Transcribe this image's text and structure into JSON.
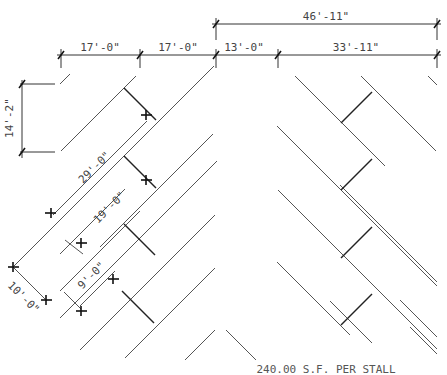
{
  "diagram": {
    "footer_text": "240.00 S.F. PER STALL",
    "dimensions": {
      "overall_top": "46'-11\"",
      "segment_1": "17'-0\"",
      "segment_2": "17'-0\"",
      "segment_3": "13'-0\"",
      "segment_4": "33'-11\"",
      "vertical_left": "14'-2\"",
      "diag_29": "29'-0\"",
      "diag_19": "19'-0\"",
      "diag_9": "9'-0\"",
      "diag_10": "10'-0\""
    },
    "colors": {
      "line": "#555555",
      "stall_divider": "#222222",
      "text": "#444444",
      "background": "#ffffff"
    }
  }
}
